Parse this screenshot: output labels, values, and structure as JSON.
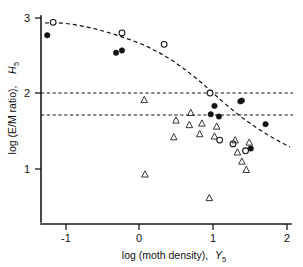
{
  "chart_data": {
    "type": "scatter",
    "title": "",
    "xlabel": "log (moth density), Y5",
    "xlabel_main": "log (moth density),",
    "xlabel_symbol": "Y",
    "xlabel_symbol_sub": "5",
    "ylabel": "log (E/M ratio), H5",
    "ylabel_main": "log (E/M ratio),",
    "ylabel_symbol": "H",
    "ylabel_symbol_sub": "5",
    "xlim": [
      -1.35,
      2.02
    ],
    "ylim": [
      0.35,
      3.05
    ],
    "xticks": [
      -1,
      0,
      1,
      2
    ],
    "xtick_labels": [
      "-1",
      "0",
      "1",
      "2"
    ],
    "yticks": [
      1,
      2,
      3
    ],
    "ytick_labels": [
      "1",
      "2",
      "3"
    ],
    "grid": false,
    "legend": "none",
    "series": [
      {
        "name": "open-circle",
        "marker": "open circle",
        "points": [
          [
            -1.16,
            2.93
          ],
          [
            -0.23,
            2.79
          ],
          [
            0.34,
            2.64
          ],
          [
            0.96,
            2.0
          ],
          [
            1.09,
            1.38
          ],
          [
            1.27,
            1.33
          ],
          [
            1.44,
            1.24
          ]
        ]
      },
      {
        "name": "filled-circle",
        "marker": "filled circle",
        "points": [
          [
            -1.24,
            2.76
          ],
          [
            -0.31,
            2.53
          ],
          [
            -0.23,
            2.56
          ],
          [
            1.02,
            1.83
          ],
          [
            0.97,
            1.72
          ],
          [
            1.08,
            1.69
          ],
          [
            1.37,
            1.89
          ],
          [
            1.39,
            1.9
          ],
          [
            1.71,
            1.59
          ],
          [
            1.51,
            1.27
          ]
        ]
      },
      {
        "name": "open-triangle",
        "marker": "open triangle",
        "points": [
          [
            0.07,
            1.91
          ],
          [
            0.5,
            1.64
          ],
          [
            0.47,
            1.42
          ],
          [
            0.7,
            1.74
          ],
          [
            0.68,
            1.58
          ],
          [
            0.85,
            1.6
          ],
          [
            0.82,
            1.46
          ],
          [
            1.02,
            1.43
          ],
          [
            1.05,
            1.56
          ],
          [
            1.3,
            1.38
          ],
          [
            1.33,
            1.22
          ],
          [
            1.39,
            1.1
          ],
          [
            1.45,
            0.99
          ],
          [
            1.49,
            1.35
          ],
          [
            0.08,
            0.93
          ],
          [
            0.95,
            0.62
          ]
        ]
      }
    ],
    "reference_lines": [
      {
        "orientation": "horizontal",
        "value": 2.0,
        "style": "dashed"
      },
      {
        "orientation": "horizontal",
        "value": 1.7,
        "style": "dashed"
      }
    ],
    "fit_curve": {
      "style": "dashed",
      "description": "descending curve",
      "points": [
        [
          -1.3,
          2.93
        ],
        [
          -1.0,
          2.93
        ],
        [
          -0.6,
          2.86
        ],
        [
          -0.2,
          2.74
        ],
        [
          0.2,
          2.58
        ],
        [
          0.6,
          2.38
        ],
        [
          0.85,
          2.18
        ],
        [
          1.0,
          2.0
        ],
        [
          1.15,
          1.8
        ],
        [
          1.35,
          1.55
        ],
        [
          1.55,
          1.36
        ],
        [
          1.8,
          1.19
        ],
        [
          1.98,
          1.1
        ]
      ]
    }
  }
}
